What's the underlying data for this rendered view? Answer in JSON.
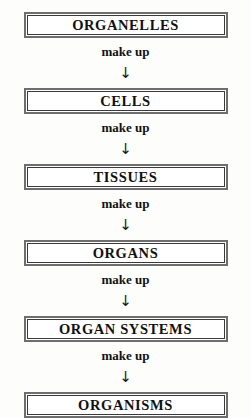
{
  "diagram": {
    "colors": {
      "background": "#fdfdfb",
      "box_fill": "#ffffff",
      "box_border_outer": "#6e6e6e",
      "box_border_inner": "#3a3a3a",
      "text": "#111111"
    },
    "nodes": [
      {
        "label": "ORGANELLES"
      },
      {
        "label": "CELLS"
      },
      {
        "label": "TISSUES"
      },
      {
        "label": "ORGANS"
      },
      {
        "label": "ORGAN SYSTEMS"
      },
      {
        "label": "ORGANISMS"
      }
    ],
    "connectors": [
      {
        "label": "make up",
        "arrow": "↓",
        "arrow_icon": "arrow-down-icon"
      },
      {
        "label": "make up",
        "arrow": "↓",
        "arrow_icon": "arrow-down-icon"
      },
      {
        "label": "make up",
        "arrow": "↓",
        "arrow_icon": "arrow-down-icon"
      },
      {
        "label": "make up",
        "arrow": "↓",
        "arrow_icon": "arrow-down-icon"
      },
      {
        "label": "make up",
        "arrow": "↓",
        "arrow_icon": "arrow-down-icon"
      }
    ]
  }
}
